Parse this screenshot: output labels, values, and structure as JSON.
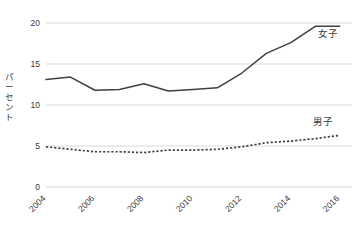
{
  "chart_data": {
    "type": "line",
    "title": "",
    "xlabel": "",
    "ylabel": "パーセント",
    "ylim": [
      0,
      20
    ],
    "xlim": [
      2004,
      2016.5
    ],
    "ytick_labels": [
      "20",
      "15",
      "10",
      "5",
      "0"
    ],
    "ytick_values": [
      20,
      15,
      10,
      5,
      0
    ],
    "xtick_labels": [
      "2004",
      "2006",
      "2008",
      "2010",
      "2012",
      "2014",
      "2016"
    ],
    "xtick_values": [
      2004,
      2006,
      2008,
      2010,
      2012,
      2014,
      2016
    ],
    "grid": "horizontal",
    "legend_position": "inline-right",
    "x": [
      2004,
      2005,
      2006,
      2007,
      2008,
      2009,
      2010,
      2011,
      2012,
      2013,
      2014,
      2015,
      2016
    ],
    "series": [
      {
        "name": "女子",
        "style": "solid",
        "color": "#404040",
        "label_x": 2015.1,
        "label_y": 18.3,
        "values": [
          13.1,
          13.4,
          11.8,
          11.9,
          12.6,
          11.7,
          11.9,
          12.1,
          13.9,
          16.3,
          17.6,
          19.6,
          19.6
        ]
      },
      {
        "name": "男子",
        "style": "dotted",
        "color": "#404040",
        "label_x": 2014.9,
        "label_y": 7.6,
        "values": [
          4.9,
          4.6,
          4.3,
          4.3,
          4.2,
          4.5,
          4.5,
          4.6,
          4.9,
          5.4,
          5.6,
          5.9,
          6.3
        ]
      }
    ],
    "colors": {
      "grid": "#d9d9d9",
      "text": "#3a3a3a",
      "line": "#404040",
      "background": "#ffffff"
    }
  }
}
